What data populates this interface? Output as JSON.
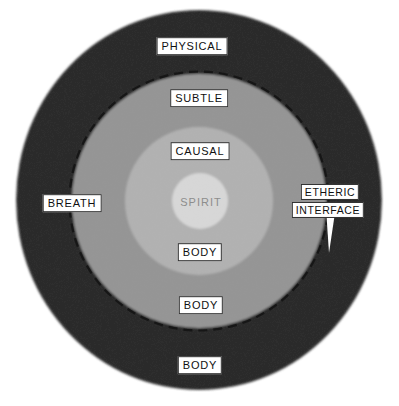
{
  "diagram": {
    "labels": {
      "physical": "PHYSICAL",
      "subtle": "SUBTLE",
      "causal": "CAUSAL",
      "spirit": "SPIRIT",
      "causal_body": "BODY",
      "subtle_body": "BODY",
      "physical_body": "BODY",
      "breath": "BREATH",
      "etheric": "ETHERIC",
      "interface": "INTERFACE"
    },
    "colors": {
      "background": "#ffffff",
      "physical_ring": "#2b2b2b",
      "subtle_ring": "#959595",
      "causal_ring": "#b1b1b1",
      "spirit_core": "#d7d7d7",
      "etheric_dash_line": "#161616",
      "label_bg": "#ffffff",
      "label_border": "#2f2f2f",
      "label_text": "#101010",
      "spirit_text": "#8d8d8d",
      "pointer_stem": "#ffffff"
    }
  }
}
